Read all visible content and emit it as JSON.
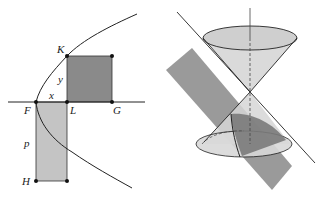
{
  "left_figure": {
    "description": "Parabola with square KLG area equal to rectangle FLH (latus rectum p)",
    "labels": {
      "K": "K",
      "F": "F",
      "L": "L",
      "G": "G",
      "H": "H",
      "x": "x",
      "y": "y",
      "p": "p"
    },
    "colors": {
      "square_fill": "#8a8a8a",
      "rect_fill": "#c4c4c4",
      "stroke": "#222222"
    }
  },
  "right_figure": {
    "description": "Double cone cut by an inclined plane producing a parabolic section",
    "colors": {
      "cone_fill": "#d6d6d6",
      "plane_fill": "#9a9a9a",
      "section_fill": "#7a7a7a",
      "stroke": "#222222"
    }
  }
}
